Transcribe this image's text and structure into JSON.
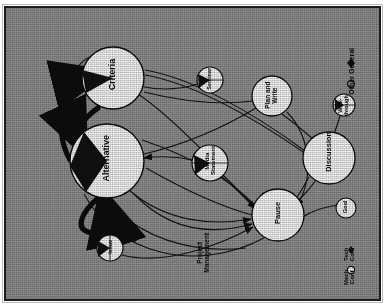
{
  "figure": {
    "title": "Unsupported",
    "background_color": "#8f8f8f",
    "ink_color": "#101010",
    "node_fill": "#f5f5f5",
    "wedge_color": "#111111",
    "orientation": "rotated-90-ccw"
  },
  "nodes": [
    {
      "id": "criteria",
      "label": "Criteria",
      "cx": 107,
      "cy": 70,
      "r": 31,
      "wedge_deg": 52,
      "wedge_start_deg": 150,
      "size": "large"
    },
    {
      "id": "alternative",
      "label": "Alternative",
      "cx": 101,
      "cy": 153,
      "r": 37,
      "wedge_deg": 132,
      "wedge_start_deg": 128,
      "size": "large"
    },
    {
      "id": "issue",
      "label": "Issue",
      "cx": 104,
      "cy": 240,
      "r": 13,
      "wedge_deg": 96,
      "wedge_start_deg": 140,
      "size": "small"
    },
    {
      "id": "media",
      "label": "Media\nStatement",
      "cx": 204,
      "cy": 155,
      "r": 18,
      "wedge_deg": 104,
      "wedge_start_deg": 160,
      "size": "medium"
    },
    {
      "id": "seminar",
      "label": "Seminar",
      "cx": 204,
      "cy": 72,
      "r": 13,
      "wedge_deg": 86,
      "wedge_start_deg": 160,
      "size": "small"
    },
    {
      "id": "planwrite",
      "label": "Plan and\nWrite",
      "cx": 266,
      "cy": 88,
      "r": 20,
      "wedge_deg": 0,
      "wedge_start_deg": 0,
      "size": "medium"
    },
    {
      "id": "pause",
      "label": "Pause",
      "cx": 272,
      "cy": 207,
      "r": 26,
      "wedge_deg": 0,
      "wedge_start_deg": 0,
      "size": "medium"
    },
    {
      "id": "discussion",
      "label": "Discussion",
      "cx": 323,
      "cy": 150,
      "r": 26,
      "wedge_deg": 0,
      "wedge_start_deg": 0,
      "size": "medium"
    },
    {
      "id": "walkthrough",
      "label": "Walk-\nthrough",
      "cx": 338,
      "cy": 97,
      "r": 11,
      "wedge_deg": 78,
      "wedge_start_deg": 172,
      "size": "small"
    },
    {
      "id": "goal",
      "label": "Goal",
      "cx": 340,
      "cy": 200,
      "r": 10,
      "wedge_deg": 0,
      "wedge_start_deg": 0,
      "size": "small"
    }
  ],
  "edge_labels": [
    {
      "id": "projmgmt",
      "label": "Project\nManagement",
      "x": 197,
      "y": 243
    }
  ],
  "legend": {
    "title": "Other General",
    "items": [
      {
        "marker": "filled-diamond",
        "label": "Other General"
      },
      {
        "marker": "open-circle",
        "label": ""
      }
    ],
    "bottom_group": [
      {
        "marker": "filled-diamond",
        "label": "Tech Conf"
      },
      {
        "marker": "open-circle",
        "label": "Mech Conf"
      }
    ]
  },
  "edges": [
    {
      "from": "alternative",
      "to": "criteria",
      "style": "thick-curve",
      "arrow": true
    },
    {
      "from": "criteria",
      "to": "alternative",
      "style": "thick-curve",
      "arrow": true
    },
    {
      "from": "alternative",
      "to": "alternative",
      "style": "self-loop",
      "arrow": true
    },
    {
      "from": "issue",
      "to": "alternative",
      "style": "thin",
      "arrow": true
    },
    {
      "from": "media",
      "to": "pause",
      "style": "thin",
      "arrow": true
    },
    {
      "from": "media",
      "to": "alternative",
      "style": "thin",
      "arrow": true
    },
    {
      "from": "seminar",
      "to": "criteria",
      "style": "thin",
      "arrow": false
    },
    {
      "from": "planwrite",
      "to": "pause",
      "style": "thin",
      "arrow": true
    },
    {
      "from": "discussion",
      "to": "pause",
      "style": "thin",
      "arrow": true
    },
    {
      "from": "discussion",
      "to": "criteria",
      "style": "thin",
      "arrow": false
    },
    {
      "from": "pause",
      "to": "alternative",
      "style": "thin",
      "arrow": true
    }
  ]
}
